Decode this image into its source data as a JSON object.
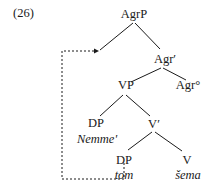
{
  "example_number": "(26)",
  "nodes": {
    "agrp": "AgrP",
    "agr_bar": "Agr′",
    "vp": "VP",
    "agr_head": "Agr°",
    "dp_subject": "DP",
    "subject_word": "Nemme'",
    "v_bar": "V′",
    "dp_object": "DP",
    "object_word": "tom",
    "v_head": "V",
    "verb_word": "šema"
  },
  "colors": {
    "text": "#1a1a1a",
    "lines": "#1a1a1a",
    "background": "#ffffff"
  }
}
